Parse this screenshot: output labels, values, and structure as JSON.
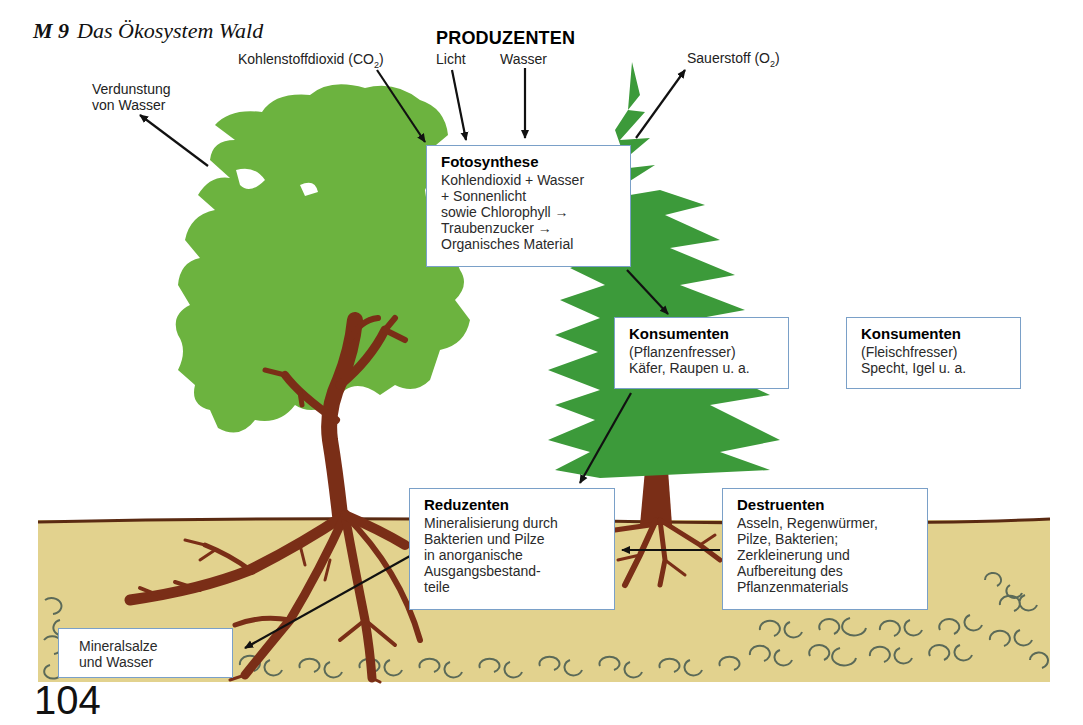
{
  "title": {
    "label": "M 9",
    "text": "Das Ökosystem Wald"
  },
  "heading": "PRODUZENTEN",
  "inputs": {
    "co2": {
      "text": "Kohlenstoffdioxid (CO",
      "sub": "2",
      "close": ")"
    },
    "licht": "Licht",
    "wasser": "Wasser",
    "sauerstoff": {
      "text": "Sauerstoff (O",
      "sub": "2",
      "close": ")"
    },
    "verdunstung": [
      "Verdunstung",
      "von Wasser"
    ]
  },
  "boxes": {
    "fotosynthese": {
      "title": "Fotosynthese",
      "lines": [
        "Kohlendioxid + Wasser",
        "+ Sonnenlicht",
        "sowie Chlorophyll →",
        "Traubenzucker →",
        "Organisches Material"
      ]
    },
    "konsumenten_pflanzen": {
      "title": "Konsumenten",
      "lines": [
        "(Pflanzenfresser)",
        "Käfer, Raupen u. a."
      ]
    },
    "konsumenten_fleisch": {
      "title": "Konsumenten",
      "lines": [
        "(Fleischfresser)",
        "Specht, Igel u. a."
      ]
    },
    "reduzenten": {
      "title": "Reduzenten",
      "lines": [
        "Mineralisierung durch",
        "Bakterien und Pilze",
        "in anorganische",
        "Ausgangsbestand-",
        "teile"
      ]
    },
    "destruenten": {
      "title": "Destruenten",
      "lines": [
        "Asseln, Regenwürmer,",
        "Pilze, Bakterien;",
        "Zerkleinerung und",
        "Aufbereitung des",
        "Pflanzenmaterials"
      ]
    },
    "mineralsalze": {
      "lines": [
        "Mineralsalze",
        "und Wasser"
      ]
    }
  },
  "page_number": "104",
  "colors": {
    "deciduous_green": "#6cb33f",
    "conifer_green": "#3c9a3a",
    "trunk_brown": "#7a2e17",
    "soil": "#e2d28e",
    "box_border": "#7aa0c8",
    "pebble": "#5b6a58"
  }
}
